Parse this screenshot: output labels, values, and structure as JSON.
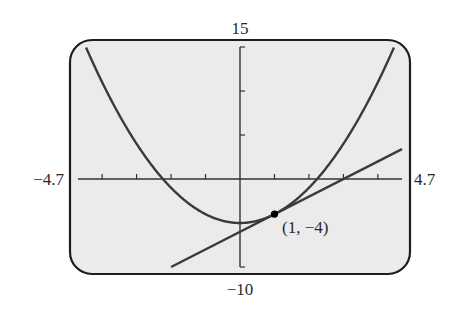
{
  "chart_data": {
    "type": "line",
    "title": "",
    "xlabel": "",
    "ylabel": "",
    "xlim": [
      -4.7,
      4.7
    ],
    "ylim": [
      -10,
      15
    ],
    "x_tick_step": 1,
    "y_tick_step": 5,
    "grid": false,
    "window_labels": {
      "xmin": "−4.7",
      "xmax": "4.7",
      "ymin": "−10",
      "ymax": "15"
    },
    "series": [
      {
        "name": "parabola",
        "equation": "y = x^2 - 5",
        "coefficients": {
          "a": 1,
          "b": 0,
          "c": -5
        }
      },
      {
        "name": "tangent-line",
        "equation": "y = 2x - 6",
        "slope": 2,
        "intercept": -6
      }
    ],
    "points": [
      {
        "x": 1,
        "y": -4,
        "label": "(1, −4)"
      }
    ]
  }
}
